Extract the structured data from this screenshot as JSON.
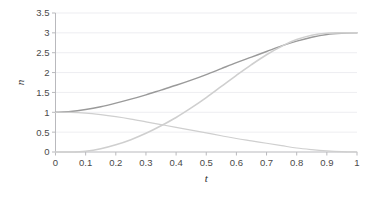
{
  "chart_data": {
    "type": "line",
    "title": "",
    "subtitle": "",
    "xlabel": "t",
    "ylabel": "n",
    "xlim": [
      0,
      1
    ],
    "ylim": [
      0,
      3.5
    ],
    "grid": true,
    "legend": "none",
    "x_ticks": [
      "0",
      "0.1",
      "0.2",
      "0.3",
      "0.4",
      "0.5",
      "0.6",
      "0.7",
      "0.8",
      "0.9",
      "1"
    ],
    "x_tick_values": [
      0,
      0.1,
      0.2,
      0.3,
      0.4,
      0.5,
      0.6,
      0.7,
      0.8,
      0.9,
      1
    ],
    "y_ticks": [
      "0",
      "0.5",
      "1",
      "1.5",
      "2",
      "2.5",
      "3",
      "3.5"
    ],
    "y_tick_values": [
      0,
      0.5,
      1,
      1.5,
      2,
      2.5,
      3,
      3.5
    ],
    "x": [
      0,
      0.05,
      0.1,
      0.15,
      0.2,
      0.25,
      0.3,
      0.35,
      0.4,
      0.45,
      0.5,
      0.55,
      0.6,
      0.65,
      0.7,
      0.75,
      0.8,
      0.85,
      0.9,
      0.95,
      1
    ],
    "series": [
      {
        "name": "total",
        "color": "#9a9a9a",
        "width": 1.4,
        "values": [
          1.0,
          1.02,
          1.07,
          1.14,
          1.23,
          1.33,
          1.44,
          1.56,
          1.68,
          1.81,
          1.95,
          2.1,
          2.25,
          2.39,
          2.53,
          2.67,
          2.79,
          2.89,
          2.96,
          2.99,
          3.0
        ]
      },
      {
        "name": "rising",
        "color": "#cfcfcf",
        "width": 1.6,
        "values": [
          0.0,
          0.0,
          0.02,
          0.08,
          0.18,
          0.31,
          0.47,
          0.66,
          0.87,
          1.11,
          1.37,
          1.65,
          1.93,
          2.2,
          2.45,
          2.66,
          2.83,
          2.94,
          2.99,
          3.0,
          3.0
        ]
      },
      {
        "name": "declining",
        "color": "#cfcfcf",
        "width": 1.2,
        "values": [
          1.0,
          1.0,
          0.98,
          0.94,
          0.89,
          0.83,
          0.76,
          0.69,
          0.62,
          0.55,
          0.48,
          0.41,
          0.34,
          0.28,
          0.22,
          0.16,
          0.1,
          0.06,
          0.03,
          0.01,
          0.0
        ]
      }
    ]
  },
  "axes": {
    "y_axis_title": "n",
    "x_axis_title": "t"
  },
  "colors": {
    "background": "#ffffff",
    "gridline": "#e8e8ee",
    "axis": "#b9b9bd",
    "tick_text": "#4a4a4a",
    "series_dark": "#9a9a9a",
    "series_light": "#cfcfcf"
  }
}
